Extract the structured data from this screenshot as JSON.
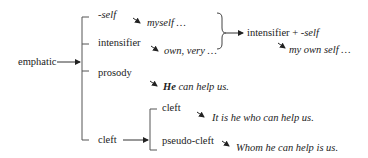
{
  "diagram": {
    "root": "emphatic",
    "branches": {
      "self": {
        "label": "-self",
        "example": "myself …"
      },
      "intensifier": {
        "label": "intensifier",
        "example": "own, very …"
      },
      "combined": {
        "label_main": "intensifier + ",
        "label_suffix": "-self",
        "example": "my own self …"
      },
      "prosody": {
        "label": "prosody",
        "example_bold": "He",
        "example_rest": " can help us."
      },
      "cleft": {
        "label": "cleft",
        "sub": [
          {
            "label": "cleft",
            "example": "It is he who can help us."
          },
          {
            "label": "pseudo-cleft",
            "example": "Whom he can help is us."
          }
        ]
      }
    }
  }
}
